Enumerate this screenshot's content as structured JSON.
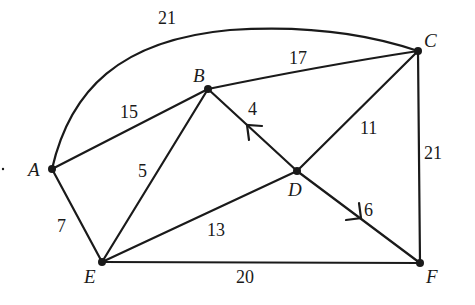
{
  "diagram": {
    "type": "weighted-graph",
    "nodes": [
      {
        "id": "A",
        "label": "A",
        "x": 52,
        "y": 169,
        "lx": 28,
        "ly": 176
      },
      {
        "id": "B",
        "label": "B",
        "x": 208,
        "y": 89,
        "lx": 193,
        "ly": 82
      },
      {
        "id": "C",
        "label": "C",
        "x": 418,
        "y": 51,
        "lx": 424,
        "ly": 47
      },
      {
        "id": "D",
        "label": "D",
        "x": 297,
        "y": 171,
        "lx": 288,
        "ly": 196
      },
      {
        "id": "E",
        "label": "E",
        "x": 102,
        "y": 262,
        "lx": 84,
        "ly": 283
      },
      {
        "id": "F",
        "label": "F",
        "x": 420,
        "y": 263,
        "lx": 426,
        "ly": 283
      }
    ],
    "edges": [
      {
        "from": "A",
        "to": "C",
        "weight": "21",
        "curved": true,
        "lx": 158,
        "ly": 24
      },
      {
        "from": "A",
        "to": "B",
        "weight": "15",
        "curved": false,
        "lx": 120,
        "ly": 118
      },
      {
        "from": "B",
        "to": "C",
        "weight": "17",
        "curved": false,
        "lx": 289,
        "ly": 64
      },
      {
        "from": "B",
        "to": "E",
        "weight": "5",
        "curved": false,
        "lx": 138,
        "ly": 177
      },
      {
        "from": "B",
        "to": "D",
        "weight": "4",
        "curved": false,
        "lx": 248,
        "ly": 115,
        "arrow": "toward-B"
      },
      {
        "from": "C",
        "to": "D",
        "weight": "11",
        "curved": false,
        "lx": 360,
        "ly": 134
      },
      {
        "from": "C",
        "to": "F",
        "weight": "21",
        "curved": false,
        "lx": 424,
        "ly": 159
      },
      {
        "from": "D",
        "to": "E",
        "weight": "13",
        "curved": false,
        "lx": 207,
        "ly": 236
      },
      {
        "from": "D",
        "to": "F",
        "weight": "6",
        "curved": false,
        "lx": 364,
        "ly": 216,
        "arrow": "toward-F"
      },
      {
        "from": "A",
        "to": "E",
        "weight": "7",
        "curved": false,
        "lx": 57,
        "ly": 232
      },
      {
        "from": "E",
        "to": "F",
        "weight": "20",
        "curved": false,
        "lx": 236,
        "ly": 283
      }
    ]
  }
}
